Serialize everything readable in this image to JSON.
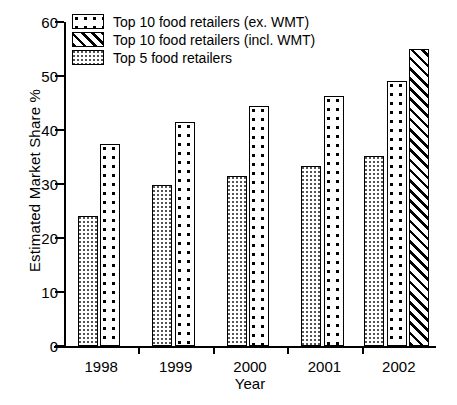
{
  "chart_data": {
    "type": "bar",
    "title": "",
    "xlabel": "Year",
    "ylabel": "Estimated Market Share %",
    "categories": [
      "1998",
      "1999",
      "2000",
      "2001",
      "2002"
    ],
    "ylim": [
      0,
      60
    ],
    "yticks": [
      0,
      10,
      20,
      30,
      40,
      50,
      60
    ],
    "ytick_labels": [
      "0",
      "10",
      "20",
      "30",
      "40",
      "50",
      "60"
    ],
    "grid": false,
    "legend_position": "upper-left",
    "series": [
      {
        "name": "Top 10 food retailers (ex. WMT)",
        "pattern": "large-dots",
        "values": [
          37.5,
          41.5,
          44.5,
          46.3,
          49.0
        ]
      },
      {
        "name": "Top 10 food retailers (incl. WMT)",
        "pattern": "diagonal-hatch",
        "values": [
          null,
          null,
          null,
          null,
          55.0
        ]
      },
      {
        "name": "Top 5 food retailers",
        "pattern": "fine-dots",
        "values": [
          24.0,
          29.8,
          31.5,
          33.3,
          35.2
        ]
      }
    ]
  },
  "legend": {
    "items": [
      {
        "label": "Top 10 food retailers (ex. WMT)"
      },
      {
        "label": "Top 10 food retailers (incl. WMT)"
      },
      {
        "label": "Top 5 food retailers"
      }
    ]
  },
  "axes": {
    "y_title": "Estimated Market Share %",
    "x_title": "Year",
    "y_labels": [
      "60",
      "50",
      "40",
      "30",
      "20",
      "10",
      "0"
    ],
    "x_labels": [
      "1998",
      "1999",
      "2000",
      "2001",
      "2002"
    ]
  },
  "colors": {
    "ink": "#000000",
    "background": "#ffffff",
    "fine_dot": "#555555"
  }
}
